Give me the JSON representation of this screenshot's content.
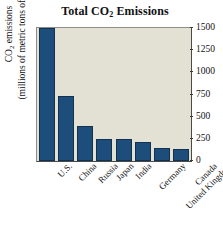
{
  "chart_data": {
    "type": "bar",
    "title": "Total CO2 Emissions",
    "title_main": "Total CO",
    "title_sub": "2",
    "title_tail": " Emissions",
    "xlabel": "",
    "ylabel_line1_main": "CO",
    "ylabel_line1_sub": "2",
    "ylabel_line1_tail": " emissions",
    "ylabel_line2": "(millions of metric tons of carbon)",
    "categories": [
      "U.S.",
      "China",
      "Russia",
      "Japan",
      "India",
      "Germany",
      "United Kingdom",
      "Canada"
    ],
    "values": [
      1500,
      735,
      395,
      250,
      245,
      215,
      145,
      140
    ],
    "ylim": [
      0,
      1500
    ],
    "yticks": [
      0,
      250,
      500,
      750,
      1000,
      1250,
      1500
    ],
    "ytick_labels": [
      "0",
      "250",
      "500",
      "750",
      "1000",
      "1250",
      "1500"
    ],
    "grid": false,
    "legend": null,
    "axis_position": "right",
    "bar_color": "#1d4d7a",
    "bar_edge_color": "#13324f",
    "plot_background": "#e3e1d3",
    "figure_background": "#ffffff"
  }
}
